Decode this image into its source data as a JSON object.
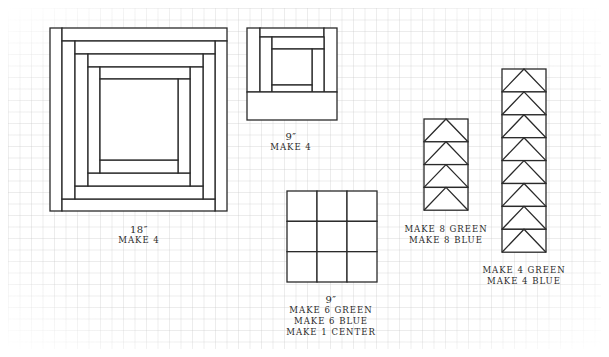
{
  "diagram": {
    "colors": {
      "line": "#2a2a2a",
      "background": "#ffffff",
      "grid": "#e6e6e6"
    },
    "blocks": [
      {
        "id": "log-cabin-18",
        "type": "log-cabin",
        "size_label": "18″",
        "instructions": [
          "MAKE 4"
        ],
        "label_pos": {
          "x": 139,
          "y": 224
        },
        "pieces": [
          [
            50,
            28,
            12,
            183
          ],
          [
            62,
            28,
            165,
            13
          ],
          [
            215,
            41,
            12,
            170
          ],
          [
            62,
            199,
            153,
            12
          ],
          [
            62,
            41,
            13,
            158
          ],
          [
            75,
            41,
            140,
            13
          ],
          [
            203,
            54,
            12,
            145
          ],
          [
            75,
            186,
            128,
            13
          ],
          [
            75,
            54,
            13,
            132
          ],
          [
            88,
            54,
            115,
            13
          ],
          [
            190,
            67,
            13,
            119
          ],
          [
            88,
            173,
            102,
            13
          ],
          [
            88,
            67,
            12,
            106
          ],
          [
            100,
            67,
            90,
            12
          ],
          [
            178,
            79,
            12,
            94
          ],
          [
            100,
            160,
            78,
            13
          ],
          [
            100,
            79,
            78,
            81
          ]
        ]
      },
      {
        "id": "log-cabin-9",
        "type": "log-cabin",
        "size_label": "9″",
        "instructions": [
          "MAKE 4"
        ],
        "label_pos": {
          "x": 291,
          "y": 131
        },
        "pieces": [
          [
            247,
            28,
            13,
            64
          ],
          [
            260,
            28,
            64,
            9
          ],
          [
            324,
            28,
            13,
            64
          ],
          [
            260,
            37,
            12,
            55
          ],
          [
            272,
            37,
            52,
            12
          ],
          [
            312,
            49,
            12,
            43
          ],
          [
            272,
            49,
            40,
            36
          ],
          [
            272,
            85,
            40,
            7
          ],
          [
            247,
            92,
            90,
            28
          ]
        ]
      },
      {
        "id": "nine-patch-9",
        "type": "nine-patch",
        "size_label": "9″",
        "instructions": [
          "MAKE 6 GREEN",
          "MAKE 6 BLUE",
          "MAKE 1 CENTER"
        ],
        "label_pos": {
          "x": 331,
          "y": 294
        },
        "x": 287,
        "y": 191,
        "width": 90,
        "height": 91,
        "rows": 3,
        "cols": 3
      },
      {
        "id": "flying-geese-4",
        "type": "flying-geese",
        "size_label": "",
        "instructions": [
          "MAKE 8 GREEN",
          "MAKE 8 BLUE"
        ],
        "label_pos": {
          "x": 446,
          "y": 224
        },
        "x": 424,
        "y": 119,
        "width": 44,
        "unit_height": 22.8,
        "count": 4
      },
      {
        "id": "flying-geese-8",
        "type": "flying-geese",
        "size_label": "",
        "instructions": [
          "MAKE 4 GREEN",
          "MAKE 4 BLUE"
        ],
        "label_pos": {
          "x": 524,
          "y": 265
        },
        "x": 502,
        "y": 69,
        "width": 44,
        "unit_height": 22.9,
        "count": 8
      }
    ]
  }
}
